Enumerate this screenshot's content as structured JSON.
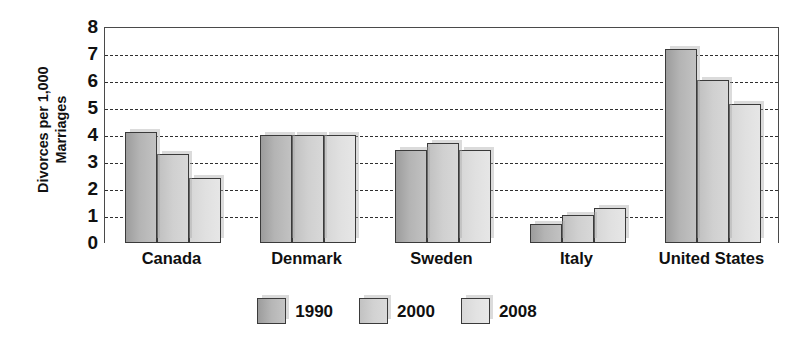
{
  "chart_data": {
    "type": "bar",
    "title": "",
    "subtitle": "",
    "xlabel": "",
    "ylabel": "Divorces per 1,000 Marriages",
    "ylim": [
      0,
      8
    ],
    "ytick_labels": [
      "8",
      "7",
      "6",
      "5",
      "4",
      "3",
      "2",
      "1",
      "0"
    ],
    "ytick_values": [
      8,
      7,
      6,
      5,
      4,
      3,
      2,
      1,
      0
    ],
    "grid": true,
    "grid_style": "dashed-horizontal",
    "legend_position": "bottom-center",
    "categories": [
      "Canada",
      "Denmark",
      "Sweden",
      "Italy",
      "United States"
    ],
    "series": [
      {
        "name": "1990",
        "color": "#b0b0b0",
        "values": [
          4.1,
          4.0,
          3.45,
          0.7,
          7.2
        ]
      },
      {
        "name": "2000",
        "color": "#d0d0d0",
        "values": [
          3.3,
          4.0,
          3.7,
          1.05,
          6.05
        ]
      },
      {
        "name": "2008",
        "color": "#e2e2e2",
        "values": [
          2.4,
          4.0,
          3.45,
          1.3,
          5.15
        ]
      }
    ]
  },
  "axis": {
    "y_title": "Divorces per 1,000\nMarriages",
    "y_title_line1": "Divorces per 1,000",
    "y_title_line2": "Marriages"
  },
  "legend": {
    "items": [
      {
        "label": "1990"
      },
      {
        "label": "2000"
      },
      {
        "label": "2008"
      }
    ]
  }
}
